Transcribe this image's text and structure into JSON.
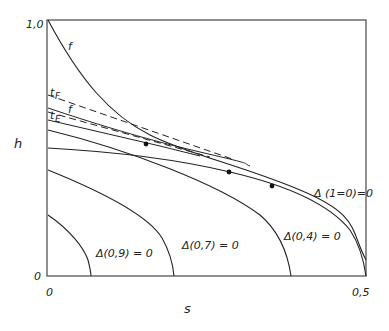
{
  "diagram": {
    "axes": {
      "x_label": "s",
      "y_label": "h",
      "x_ticks": [
        "0",
        "0,5"
      ],
      "y_ticks": [
        "0",
        "1,0"
      ],
      "x_range": [
        0,
        0.5
      ],
      "y_range": [
        0,
        1.0
      ]
    },
    "curve_labels": {
      "f_top": "f",
      "f_mid": "f",
      "t_F": "t",
      "t_F_sub": "F",
      "t_E": "t",
      "t_E_sub": "E"
    },
    "delta_labels": [
      "Δ(0,9) = 0",
      "Δ(0,7) = 0",
      "Δ(0,4) = 0",
      "Δ (1=0)=0"
    ],
    "points_count": 4,
    "colors": {
      "line": "#222222",
      "frame": "#555555",
      "background": "#ffffff"
    }
  }
}
